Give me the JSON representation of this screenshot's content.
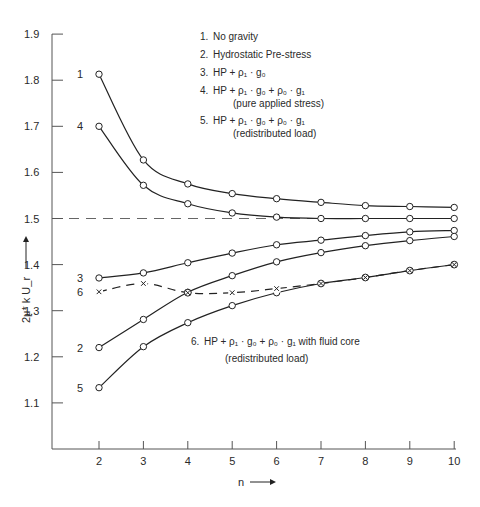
{
  "chart_data": {
    "type": "line",
    "title": "",
    "xlabel": "n",
    "ylabel": "2μ* k U_r",
    "xlim": [
      1,
      10
    ],
    "ylim": [
      1.0,
      1.9
    ],
    "x_ticks": [
      2,
      3,
      4,
      5,
      6,
      7,
      8,
      9,
      10
    ],
    "y_ticks": [
      1.1,
      1.2,
      1.3,
      1.4,
      1.5,
      1.6,
      1.7,
      1.8,
      1.9
    ],
    "y_tick_labels": [
      "1.1",
      "1.2",
      "1.3",
      "1.4",
      "1.5",
      "1.6",
      "1.7",
      "1.8",
      "1.9"
    ],
    "x_tick_labels": [
      "2",
      "3",
      "4",
      "5",
      "6",
      "7",
      "8",
      "9",
      "10"
    ],
    "reference_line": {
      "y": 1.5,
      "style": "dashed"
    },
    "grid": false,
    "legend_placement": "top-right",
    "legend": [
      {
        "number": "1.",
        "text": "No gravity"
      },
      {
        "number": "2.",
        "text": "Hydrostatic Pre-stress"
      },
      {
        "number": "3.",
        "text": "HP + ρ₁ · g₀"
      },
      {
        "number": "4.",
        "text": "HP + ρ₁ · g₀ + ρ₀ · g₁",
        "note": "(pure applied stress)"
      },
      {
        "number": "5.",
        "text": "HP + ρ₁ · g₀ + ρ₀ · g₁",
        "note": "(redistributed load)"
      }
    ],
    "annotation": {
      "number": "6.",
      "text": "HP + ρ₁ · g₀ + ρ₀ · g₁ with fluid core",
      "note": "(redistributed load)"
    },
    "x": [
      2,
      3,
      4,
      5,
      6,
      7,
      8,
      9,
      10
    ],
    "series": [
      {
        "name": "1",
        "label": "1",
        "marker": "circle",
        "style": "solid",
        "values": [
          1.813,
          1.627,
          1.575,
          1.554,
          1.543,
          1.535,
          1.528,
          1.526,
          1.524
        ]
      },
      {
        "name": "4",
        "label": "4",
        "marker": "circle",
        "style": "solid",
        "values": [
          1.7,
          1.572,
          1.532,
          1.512,
          1.503,
          1.5,
          1.5,
          1.5,
          1.5
        ]
      },
      {
        "name": "3",
        "label": "3",
        "marker": "circle",
        "style": "solid",
        "values": [
          1.371,
          1.382,
          1.404,
          1.425,
          1.443,
          1.453,
          1.463,
          1.471,
          1.474
        ]
      },
      {
        "name": "2",
        "label": "2",
        "marker": "circle",
        "style": "solid",
        "values": [
          1.22,
          1.281,
          1.34,
          1.376,
          1.406,
          1.426,
          1.441,
          1.452,
          1.461
        ]
      },
      {
        "name": "5",
        "label": "5",
        "marker": "circle",
        "style": "solid",
        "values": [
          1.133,
          1.222,
          1.274,
          1.311,
          1.339,
          1.359,
          1.372,
          1.387,
          1.4
        ]
      },
      {
        "name": "6",
        "label": "6",
        "marker": "x",
        "style": "dashed",
        "values": [
          1.341,
          1.359,
          1.339,
          1.339,
          1.348,
          1.359,
          1.372,
          1.387,
          1.4
        ]
      }
    ]
  }
}
